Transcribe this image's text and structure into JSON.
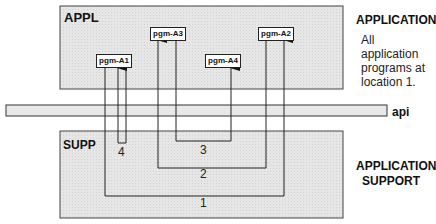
{
  "diagram": {
    "appl_box": {
      "label": "APPL"
    },
    "supp_box": {
      "label": "SUPP"
    },
    "api_bar": {
      "label": "api"
    },
    "programs": [
      {
        "id": "pgm-A1",
        "label": "pgm-A1"
      },
      {
        "id": "pgm-A3",
        "label": "pgm-A3"
      },
      {
        "id": "pgm-A4",
        "label": "pgm-A4"
      },
      {
        "id": "pgm-A2",
        "label": "pgm-A2"
      }
    ],
    "side_labels": {
      "application": {
        "title": "APPLICATION",
        "desc_lines": [
          "All application",
          "programs at",
          "location 1."
        ]
      },
      "application_support": {
        "title_lines": [
          "APPLICATION",
          "SUPPORT"
        ]
      }
    },
    "paths": [
      {
        "number": "1",
        "to": "pgm-A2"
      },
      {
        "number": "2",
        "to": "pgm-A3"
      },
      {
        "number": "3",
        "to": "pgm-A4"
      },
      {
        "number": "4",
        "to": "pgm-A1"
      }
    ],
    "colors": {
      "box_fill": "#e4e4e4",
      "line": "#222222"
    }
  }
}
